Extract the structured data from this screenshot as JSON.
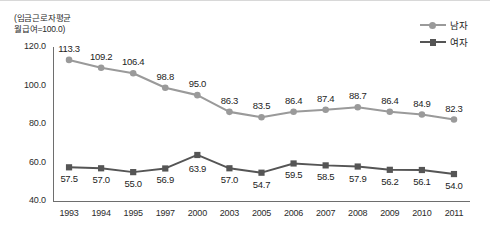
{
  "axis_note": "(임금근로자평균\n월급여=100.0)",
  "legend": {
    "position": "top-right",
    "entries": [
      {
        "label": "남자",
        "marker": "circle-marker-icon",
        "color": "#9a9a9a"
      },
      {
        "label": "여자",
        "marker": "square-marker-icon",
        "color": "#555555"
      }
    ]
  },
  "colors": {
    "male": "#9a9a9a",
    "female": "#555555",
    "axis": "#6e6e6e",
    "text": "#1d1d1d"
  },
  "chart_data": {
    "type": "line",
    "title": "",
    "subtitle": "",
    "xlabel": "",
    "ylabel": "(임금근로자평균 월급여=100.0)",
    "categories": [
      "1993",
      "1994",
      "1995",
      "1997",
      "2000",
      "2003",
      "2005",
      "2006",
      "2007",
      "2008",
      "2009",
      "2010",
      "2011"
    ],
    "yticks": [
      "40.0",
      "60.0",
      "80.0",
      "100.0",
      "120.0"
    ],
    "ylim": [
      40.0,
      120.0
    ],
    "grid": false,
    "legend_position": "top-right",
    "series": [
      {
        "name": "남자",
        "marker": "circle",
        "color": "#9a9a9a",
        "values": [
          113.3,
          109.2,
          106.4,
          98.8,
          95.0,
          86.3,
          83.5,
          86.4,
          87.4,
          88.7,
          86.4,
          84.9,
          82.3
        ],
        "labels": [
          "113.3",
          "109.2",
          "106.4",
          "98.8",
          "95.0",
          "86.3",
          "83.5",
          "86.4",
          "87.4",
          "88.7",
          "86.4",
          "84.9",
          "82.3"
        ]
      },
      {
        "name": "여자",
        "marker": "square",
        "color": "#555555",
        "values": [
          57.5,
          57.0,
          55.0,
          56.9,
          63.9,
          57.0,
          54.7,
          59.5,
          58.5,
          57.9,
          56.2,
          56.1,
          54.0
        ],
        "labels": [
          "57.5",
          "57.0",
          "55.0",
          "56.9",
          "63.9",
          "57.0",
          "54.7",
          "59.5",
          "58.5",
          "57.9",
          "56.2",
          "56.1",
          "54.0"
        ]
      }
    ]
  }
}
